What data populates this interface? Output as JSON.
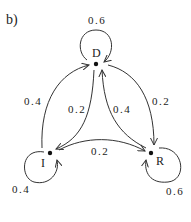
{
  "panel_label": "b)",
  "nodes": {
    "D": {
      "label": "D"
    },
    "I": {
      "label": "I"
    },
    "R": {
      "label": "R"
    }
  },
  "edges": {
    "D_D": {
      "from": "D",
      "to": "D",
      "prob": "0.6"
    },
    "I_D": {
      "from": "I",
      "to": "D",
      "prob": "0.4"
    },
    "D_I": {
      "from": "D",
      "to": "I",
      "prob": "0.2"
    },
    "R_D": {
      "from": "R",
      "to": "D",
      "prob": "0.4"
    },
    "D_R": {
      "from": "D",
      "to": "R",
      "prob": "0.2"
    },
    "I_R": {
      "from": "I",
      "to": "R",
      "prob": "0.2"
    },
    "I_I": {
      "from": "I",
      "to": "I",
      "prob": "0.4"
    },
    "R_R": {
      "from": "R",
      "to": "R",
      "prob": "0.6"
    }
  },
  "colors": {
    "stroke": "#333333",
    "text": "#222222",
    "background": "#ffffff"
  }
}
